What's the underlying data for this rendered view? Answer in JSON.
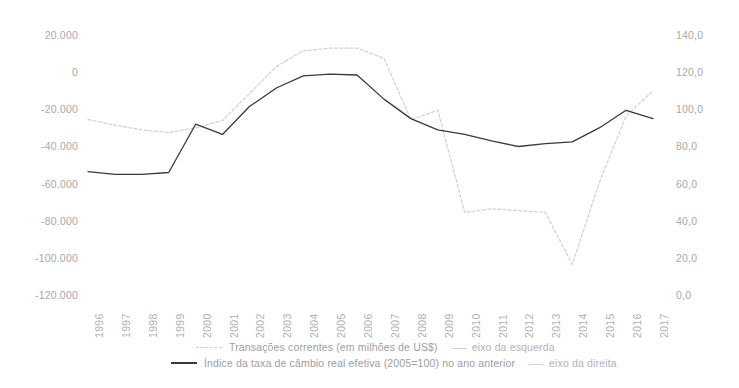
{
  "chart_data": {
    "type": "line",
    "title": "",
    "xlabel": "",
    "categories": [
      "1996",
      "1997",
      "1998",
      "1999",
      "2000",
      "2001",
      "2002",
      "2003",
      "2004",
      "2005",
      "2006",
      "2007",
      "2008",
      "2009",
      "2010",
      "2011",
      "2012",
      "2013",
      "2014",
      "2015",
      "2016",
      "2017"
    ],
    "axes": {
      "left": {
        "label": "Transações correntes (em milhões de US$)",
        "ylim": [
          -120000,
          20000
        ],
        "ticks": [
          20000,
          0,
          -20000,
          -40000,
          -60000,
          -80000,
          -100000,
          -120000
        ],
        "tick_labels": [
          "20.000",
          "0",
          "-20.000",
          "-40.000",
          "-60.000",
          "-80.000",
          "-100.000",
          "-120.000"
        ]
      },
      "right": {
        "label": "Índice da taxa de câmbio real efetiva (2005=100)",
        "ylim": [
          0,
          140
        ],
        "ticks": [
          140,
          120,
          100,
          80,
          60,
          40,
          20,
          0
        ],
        "tick_labels": [
          "140,0",
          "120,0",
          "100,0",
          "80,0",
          "60,0",
          "40,0",
          "20,0",
          "0,0"
        ]
      }
    },
    "grid": false,
    "legend_position": "bottom",
    "series": [
      {
        "name": "Transações correntes (em milhões de US$)",
        "axis": "left",
        "style": "dotted",
        "color": "#d0d0d0",
        "values": [
          -25000,
          -28000,
          -30500,
          -32000,
          -29500,
          -25500,
          -11000,
          3500,
          12000,
          13500,
          13500,
          8000,
          -25000,
          -20000,
          -75000,
          -73000,
          -74000,
          -75000,
          -103000,
          -59000,
          -23000,
          -9500
        ]
      },
      {
        "name": "Índice da taxa de câmbio real efetiva (2005=100) no ano anterior",
        "axis": "right",
        "style": "solid",
        "color": "#3a3a3a",
        "values": [
          67.0,
          65.5,
          65.5,
          66.5,
          92.5,
          87.0,
          102.0,
          112.0,
          118.5,
          119.5,
          119.0,
          106.0,
          95.5,
          89.5,
          87.0,
          83.5,
          80.5,
          82.0,
          83.0,
          90.5,
          100.0,
          95.5
        ]
      }
    ],
    "legend": [
      {
        "marker": "dashed",
        "label": "Transações  correntes (em milhões de US$)",
        "axis_note": "eixo da esquerda"
      },
      {
        "marker": "solid",
        "label": "Índice da taxa de câmbio real efetiva (2005=100) no ano anterior",
        "axis_note": "eixo da direita"
      }
    ]
  }
}
